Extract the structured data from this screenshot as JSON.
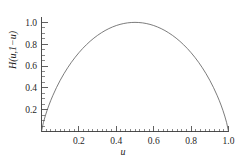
{
  "figure": {
    "background_color": "#ffffff",
    "curve_color": "#5a5a5a",
    "axis_color": "#3a3a3a",
    "text_color": "#1f1f1f"
  },
  "chart_data": {
    "type": "line",
    "title": "",
    "xlabel": "u",
    "ylabel": "H(u,1-u)",
    "ylabel_display": "H(u,1−u)",
    "xlim": [
      0.0,
      1.0
    ],
    "ylim": [
      0.0,
      1.04
    ],
    "grid": false,
    "legend": null,
    "x_ticks": [
      0.2,
      0.4,
      0.6,
      0.8,
      1.0
    ],
    "x_tick_labels": [
      "0.2",
      "0.4",
      "0.6",
      "0.8",
      "1.0"
    ],
    "x_minor_step": 0.025,
    "y_ticks": [
      0.2,
      0.4,
      0.6,
      0.8,
      1.0
    ],
    "y_tick_labels": [
      "0.2",
      "0.4",
      "0.6",
      "0.8",
      "1.0"
    ],
    "y_minor_step": 0.05,
    "series": [
      {
        "name": "H(u,1-u)",
        "function": "binary entropy: -u*log2(u) - (1-u)*log2(1-u)",
        "color": "#5a5a5a",
        "linewidth": 0.8,
        "x": [
          0.0,
          0.01,
          0.02,
          0.03,
          0.04,
          0.05,
          0.06,
          0.08,
          0.1,
          0.12,
          0.14,
          0.16,
          0.18,
          0.2,
          0.22,
          0.24,
          0.26,
          0.28,
          0.3,
          0.32,
          0.34,
          0.36,
          0.38,
          0.4,
          0.42,
          0.44,
          0.46,
          0.48,
          0.5,
          0.52,
          0.54,
          0.56,
          0.58,
          0.6,
          0.62,
          0.64,
          0.66,
          0.68,
          0.7,
          0.72,
          0.74,
          0.76,
          0.78,
          0.8,
          0.82,
          0.84,
          0.86,
          0.88,
          0.9,
          0.92,
          0.94,
          0.95,
          0.96,
          0.97,
          0.98,
          0.99,
          1.0
        ],
        "y": [
          0.0,
          0.0808,
          0.1414,
          0.1944,
          0.2423,
          0.2864,
          0.3274,
          0.4022,
          0.469,
          0.5294,
          0.5842,
          0.6343,
          0.6801,
          0.7219,
          0.7602,
          0.795,
          0.8267,
          0.8555,
          0.8813,
          0.9044,
          0.9249,
          0.9427,
          0.958,
          0.971,
          0.9815,
          0.9896,
          0.9954,
          0.9988,
          1.0,
          0.9988,
          0.9954,
          0.9896,
          0.9815,
          0.971,
          0.958,
          0.9427,
          0.9249,
          0.9044,
          0.8813,
          0.8555,
          0.8267,
          0.795,
          0.7602,
          0.7219,
          0.6801,
          0.6343,
          0.5842,
          0.5294,
          0.469,
          0.4022,
          0.3274,
          0.2864,
          0.2423,
          0.1944,
          0.1414,
          0.0808,
          0.0
        ]
      }
    ]
  }
}
